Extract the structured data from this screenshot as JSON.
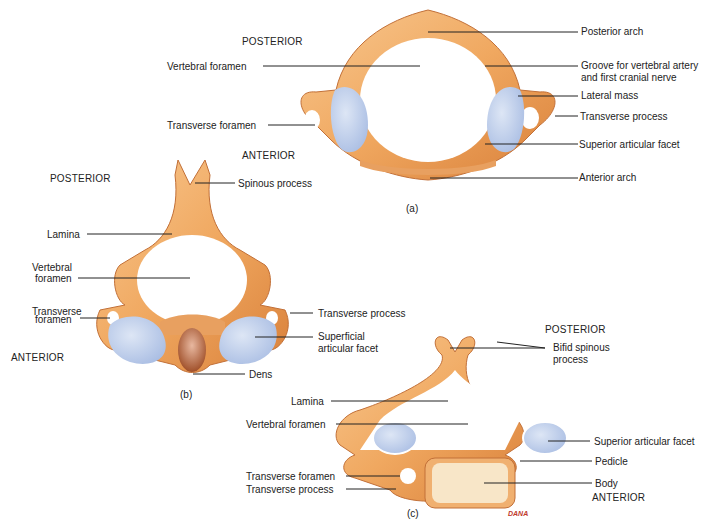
{
  "colors": {
    "bone": "#f0a860",
    "bone_dark": "#d9803a",
    "bone_light": "#f8c890",
    "facet": "#b8c8e8",
    "leader": "#222222",
    "body_marrow": "#f8e6c8"
  },
  "fig_a": {
    "caption": "(a)",
    "posterior": "POSTERIOR",
    "anterior": "ANTERIOR",
    "labels": {
      "vertebral_foramen": "Vertebral foramen",
      "transverse_foramen": "Transverse foramen",
      "posterior_arch": "Posterior arch",
      "groove": "Groove for vertebral artery",
      "groove2": "and first cranial nerve",
      "lateral_mass": "Lateral mass",
      "transverse_process": "Transverse process",
      "superior_facet": "Superior articular facet",
      "anterior_arch": "Anterior arch"
    }
  },
  "fig_b": {
    "caption": "(b)",
    "posterior": "POSTERIOR",
    "anterior": "ANTERIOR",
    "labels": {
      "spinous_process": "Spinous process",
      "lamina": "Lamina",
      "vertebral_foramen1": "Vertebral",
      "vertebral_foramen2": "foramen",
      "transverse_foramen1": "Transverse",
      "transverse_foramen2": "foramen",
      "transverse_process": "Transverse process",
      "superficial_facet1": "Superficial",
      "superficial_facet2": "articular facet",
      "dens": "Dens"
    }
  },
  "fig_c": {
    "caption": "(c)",
    "posterior": "POSTERIOR",
    "anterior": "ANTERIOR",
    "signature": "DANA",
    "labels": {
      "bifid1": "Bifid spinous",
      "bifid2": "process",
      "lamina": "Lamina",
      "vertebral_foramen": "Vertebral foramen",
      "superior_facet": "Superior articular facet",
      "pedicle": "Pedicle",
      "transverse_foramen": "Transverse foramen",
      "transverse_process": "Transverse process",
      "body": "Body"
    }
  }
}
